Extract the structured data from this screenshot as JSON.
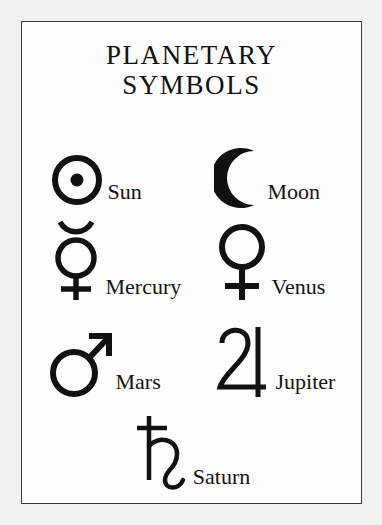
{
  "poster": {
    "title_line_1": "PLANETARY",
    "title_line_2": "SYMBOLS",
    "background_color": "#fdfdfd",
    "page_background_color": "#f1f1f1",
    "border_color": "#3a3a3a",
    "ink_color": "#111111"
  },
  "rows": [
    {
      "items": [
        {
          "name": "Sun",
          "symbol_char": "☉",
          "symbol_id": "sun-symbol"
        },
        {
          "name": "Moon",
          "symbol_char": "☽",
          "symbol_id": "moon-symbol"
        }
      ]
    },
    {
      "items": [
        {
          "name": "Mercury",
          "symbol_char": "☿",
          "symbol_id": "mercury-symbol"
        },
        {
          "name": "Venus",
          "symbol_char": "♀",
          "symbol_id": "venus-symbol"
        }
      ]
    },
    {
      "items": [
        {
          "name": "Mars",
          "symbol_char": "♂",
          "symbol_id": "mars-symbol"
        },
        {
          "name": "Jupiter",
          "symbol_char": "♃",
          "symbol_id": "jupiter-symbol"
        }
      ]
    },
    {
      "items": [
        {
          "name": "Saturn",
          "symbol_char": "♄",
          "symbol_id": "saturn-symbol"
        }
      ]
    }
  ]
}
